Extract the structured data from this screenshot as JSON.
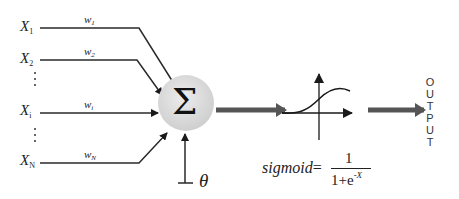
{
  "diagram": {
    "inputs": [
      {
        "label": "X",
        "sub": "1",
        "weight": "w",
        "weight_sub": "1"
      },
      {
        "label": "X",
        "sub": "2",
        "weight": "w",
        "weight_sub": "2"
      },
      {
        "label": "X",
        "sub": "i",
        "weight": "w",
        "weight_sub": "i"
      },
      {
        "label": "X",
        "sub": "N",
        "weight": "w",
        "weight_sub": "N"
      }
    ],
    "summation_symbol": "Σ",
    "bias_symbol": "θ",
    "activation": {
      "name": "sigmoid",
      "equals": "=",
      "numerator": "1",
      "denominator": "1+e",
      "exponent": "-X"
    },
    "output_label": [
      "O",
      "U",
      "T",
      "P",
      "U",
      "T"
    ],
    "colors": {
      "line": "#2a2a2a",
      "thick_arrow": "#555555",
      "node_fill": "#d9d9d9",
      "background": "#ffffff"
    }
  }
}
